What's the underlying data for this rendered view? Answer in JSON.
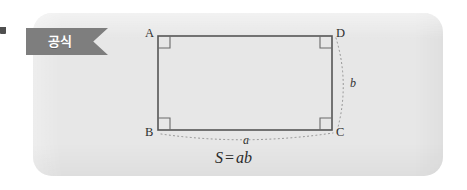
{
  "card": {
    "background_color": "#e7e7e7",
    "page_background_color": "#ffffff"
  },
  "ribbon": {
    "label": "공식",
    "background_color": "#7e7e7e",
    "text_color": "#ffffff",
    "fold_color": "#4f4f4f"
  },
  "figure": {
    "type": "rectangle-area-diagram",
    "shape": "rectangle",
    "stroke_color": "#555555",
    "dotted_arc_color": "#8c8c8c",
    "vertices": [
      {
        "id": "A",
        "label": "A",
        "position": "top-left",
        "right_angle_marked": true
      },
      {
        "id": "D",
        "label": "D",
        "position": "top-right",
        "right_angle_marked": true
      },
      {
        "id": "B",
        "label": "B",
        "position": "bottom-left",
        "right_angle_marked": true
      },
      {
        "id": "C",
        "label": "C",
        "position": "bottom-right",
        "right_angle_marked": true
      }
    ],
    "side_labels": [
      {
        "id": "a",
        "label": "a",
        "side": "BC",
        "placement": "below",
        "measure_arc": true
      },
      {
        "id": "b",
        "label": "b",
        "side": "DC",
        "placement": "right",
        "measure_arc": true
      }
    ]
  },
  "formula": {
    "result": "S",
    "operator": "=",
    "expression": "ab",
    "full_text": "S = ab"
  }
}
